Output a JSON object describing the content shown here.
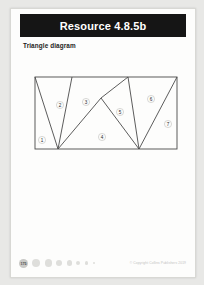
{
  "header": {
    "title": "Resource 4.8.5b"
  },
  "subtitle": "Triangle diagram",
  "diagram": {
    "name": "triangle-diagram",
    "viewbox": "0 0 167 92",
    "rect": {
      "x": 15,
      "y": 16,
      "width": 142,
      "height": 72
    },
    "vertices": {
      "top_left": [
        15,
        16
      ],
      "top_a": [
        52,
        16
      ],
      "top_b": [
        108,
        16
      ],
      "top_right": [
        157,
        16
      ],
      "bottom_left": [
        15,
        88
      ],
      "bottom_a": [
        38,
        88
      ],
      "bottom_b": [
        119,
        88
      ],
      "bottom_right": [
        157,
        88
      ],
      "interior": [
        81,
        37
      ]
    },
    "segments": [
      {
        "name": "seg-tl-ba",
        "from": [
          15,
          16
        ],
        "to": [
          38,
          88
        ]
      },
      {
        "name": "seg-ta-ba",
        "from": [
          52,
          16
        ],
        "to": [
          38,
          88
        ]
      },
      {
        "name": "seg-ba-interior",
        "from": [
          38,
          88
        ],
        "to": [
          81,
          37
        ]
      },
      {
        "name": "seg-interior-bb",
        "from": [
          81,
          37
        ],
        "to": [
          119,
          88
        ]
      },
      {
        "name": "seg-interior-tb",
        "from": [
          81,
          37
        ],
        "to": [
          108,
          16
        ]
      },
      {
        "name": "seg-tb-bb",
        "from": [
          108,
          16
        ],
        "to": [
          119,
          88
        ]
      },
      {
        "name": "seg-bb-tr",
        "from": [
          119,
          88
        ],
        "to": [
          157,
          16
        ]
      }
    ],
    "labels": [
      {
        "id": "region-1",
        "text": "1",
        "x": 22,
        "y": 79
      },
      {
        "id": "region-2",
        "text": "2",
        "x": 40,
        "y": 44
      },
      {
        "id": "region-3",
        "text": "3",
        "x": 66,
        "y": 41
      },
      {
        "id": "region-4",
        "text": "4",
        "x": 82,
        "y": 76
      },
      {
        "id": "region-5",
        "text": "5",
        "x": 100,
        "y": 51
      },
      {
        "id": "region-6",
        "text": "6",
        "x": 131,
        "y": 38
      },
      {
        "id": "region-7",
        "text": "7",
        "x": 148,
        "y": 63
      }
    ]
  },
  "footer": {
    "page_number": "175",
    "dot_count": 7,
    "copyright": "© Copyright Collins Publishers 2019"
  },
  "colors": {
    "header_bg": "#151515",
    "header_text": "#ffffff",
    "line": "#4a4a4a",
    "page_bg": "#fdfdfc",
    "canvas_bg": "#e8e8e6"
  }
}
